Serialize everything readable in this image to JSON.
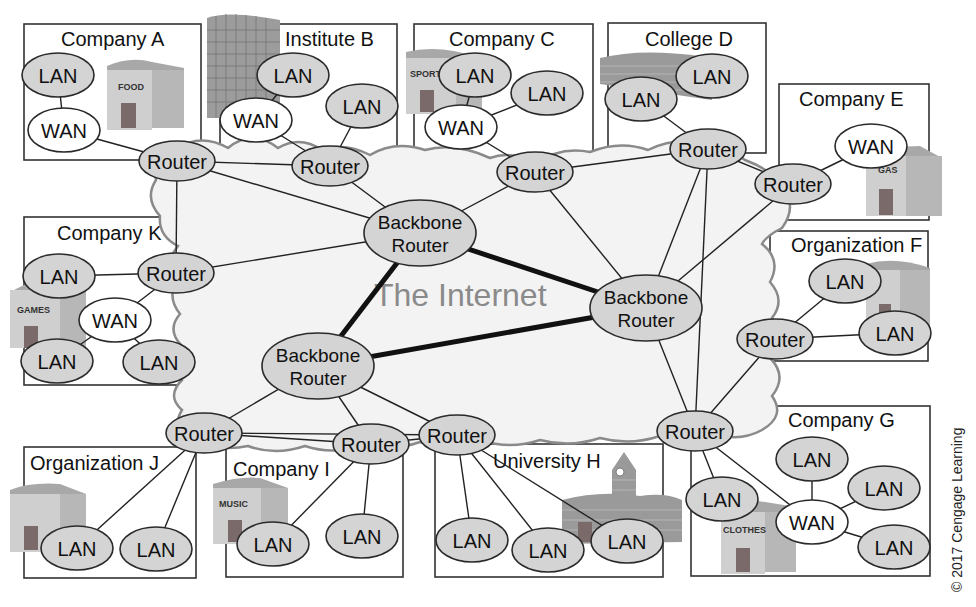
{
  "diagram": {
    "center_label": "The Internet",
    "copyright": "© 2017 Cengage Learning",
    "colors": {
      "node_fill": "#d4d4d4",
      "wan_fill": "#ffffff",
      "cloud_fill": "#f3f3f3",
      "cloud_stroke": "#8a8a8a",
      "internet_label": "#8a8a8a"
    },
    "organizations": [
      {
        "id": "A",
        "name": "Company A",
        "building_sign": "FOOD"
      },
      {
        "id": "B",
        "name": "Institute B",
        "building_sign": ""
      },
      {
        "id": "C",
        "name": "Company C",
        "building_sign": "SPORTS"
      },
      {
        "id": "D",
        "name": "College D",
        "building_sign": ""
      },
      {
        "id": "E",
        "name": "Company E",
        "building_sign": "GAS"
      },
      {
        "id": "F",
        "name": "Organization F",
        "building_sign": ""
      },
      {
        "id": "G",
        "name": "Company G",
        "building_sign": "CLOTHES"
      },
      {
        "id": "H",
        "name": "University H",
        "building_sign": ""
      },
      {
        "id": "I",
        "name": "Company I",
        "building_sign": "MUSIC"
      },
      {
        "id": "J",
        "name": "Organization J",
        "building_sign": ""
      },
      {
        "id": "K",
        "name": "Company K",
        "building_sign": "GAMES"
      }
    ],
    "node_labels": {
      "lan": "LAN",
      "wan": "WAN",
      "router": "Router",
      "backbone_line1": "Backbone",
      "backbone_line2": "Router"
    },
    "nodes": [
      {
        "id": "bb1",
        "type": "backbone",
        "x": 420,
        "y": 233
      },
      {
        "id": "bb2",
        "type": "backbone",
        "x": 646,
        "y": 308
      },
      {
        "id": "bb3",
        "type": "backbone",
        "x": 318,
        "y": 366
      },
      {
        "id": "rA",
        "type": "router",
        "x": 177,
        "y": 161,
        "org": "A"
      },
      {
        "id": "rB",
        "type": "router",
        "x": 330,
        "y": 166,
        "org": "B"
      },
      {
        "id": "rC",
        "type": "router",
        "x": 535,
        "y": 172,
        "org": "C"
      },
      {
        "id": "rD",
        "type": "router",
        "x": 708,
        "y": 149,
        "org": "D"
      },
      {
        "id": "rE",
        "type": "router",
        "x": 793,
        "y": 184,
        "org": "E"
      },
      {
        "id": "rF",
        "type": "router",
        "x": 775,
        "y": 339,
        "org": "F"
      },
      {
        "id": "rG",
        "type": "router",
        "x": 695,
        "y": 431,
        "org": "G"
      },
      {
        "id": "rH",
        "type": "router",
        "x": 457,
        "y": 435,
        "org": "H"
      },
      {
        "id": "rI",
        "type": "router",
        "x": 371,
        "y": 444,
        "org": "I"
      },
      {
        "id": "rJ",
        "type": "router",
        "x": 204,
        "y": 433,
        "org": "J"
      },
      {
        "id": "rK",
        "type": "router",
        "x": 176,
        "y": 273,
        "org": "K"
      },
      {
        "id": "lA1",
        "type": "lan",
        "x": 58,
        "y": 75
      },
      {
        "id": "wA",
        "type": "wan",
        "x": 64,
        "y": 130
      },
      {
        "id": "lB1",
        "type": "lan",
        "x": 293,
        "y": 75
      },
      {
        "id": "wB",
        "type": "wan",
        "x": 256,
        "y": 120
      },
      {
        "id": "lB2",
        "type": "lan",
        "x": 362,
        "y": 106
      },
      {
        "id": "lC1",
        "type": "lan",
        "x": 475,
        "y": 75
      },
      {
        "id": "wC",
        "type": "wan",
        "x": 461,
        "y": 127
      },
      {
        "id": "lC2",
        "type": "lan",
        "x": 547,
        "y": 93
      },
      {
        "id": "lD1",
        "type": "lan",
        "x": 641,
        "y": 99
      },
      {
        "id": "lD2",
        "type": "lan",
        "x": 712,
        "y": 76
      },
      {
        "id": "wE",
        "type": "wan",
        "x": 871,
        "y": 146
      },
      {
        "id": "lF1",
        "type": "lan",
        "x": 845,
        "y": 281
      },
      {
        "id": "lF2",
        "type": "lan",
        "x": 895,
        "y": 333
      },
      {
        "id": "lG1",
        "type": "lan",
        "x": 722,
        "y": 499
      },
      {
        "id": "wG",
        "type": "wan",
        "x": 812,
        "y": 522
      },
      {
        "id": "lG2",
        "type": "lan",
        "x": 812,
        "y": 459
      },
      {
        "id": "lG3",
        "type": "lan",
        "x": 884,
        "y": 488
      },
      {
        "id": "lG4",
        "type": "lan",
        "x": 894,
        "y": 547
      },
      {
        "id": "lH1",
        "type": "lan",
        "x": 472,
        "y": 540
      },
      {
        "id": "lH2",
        "type": "lan",
        "x": 548,
        "y": 550
      },
      {
        "id": "lH3",
        "type": "lan",
        "x": 627,
        "y": 541
      },
      {
        "id": "lI1",
        "type": "lan",
        "x": 273,
        "y": 544
      },
      {
        "id": "lI2",
        "type": "lan",
        "x": 362,
        "y": 536
      },
      {
        "id": "lJ1",
        "type": "lan",
        "x": 77,
        "y": 548
      },
      {
        "id": "lJ2",
        "type": "lan",
        "x": 156,
        "y": 549
      },
      {
        "id": "lK1",
        "type": "lan",
        "x": 59,
        "y": 276
      },
      {
        "id": "wK",
        "type": "wan",
        "x": 115,
        "y": 320
      },
      {
        "id": "lK2",
        "type": "lan",
        "x": 57,
        "y": 361
      },
      {
        "id": "lK3",
        "type": "lan",
        "x": 159,
        "y": 362
      }
    ],
    "edges": [
      {
        "from": "bb1",
        "to": "bb2",
        "kind": "backbone"
      },
      {
        "from": "bb1",
        "to": "bb3",
        "kind": "backbone"
      },
      {
        "from": "bb3",
        "to": "bb2",
        "kind": "backbone"
      },
      {
        "from": "rA",
        "to": "bb1"
      },
      {
        "from": "rA",
        "to": "rB"
      },
      {
        "from": "rA",
        "to": "rK"
      },
      {
        "from": "rB",
        "to": "bb1"
      },
      {
        "from": "rC",
        "to": "bb1"
      },
      {
        "from": "rC",
        "to": "bb2"
      },
      {
        "from": "rC",
        "to": "rD"
      },
      {
        "from": "rD",
        "to": "bb2"
      },
      {
        "from": "rD",
        "to": "rG"
      },
      {
        "from": "rD",
        "to": "rE"
      },
      {
        "from": "rE",
        "to": "bb2"
      },
      {
        "from": "rK",
        "to": "bb1"
      },
      {
        "from": "rF",
        "to": "rG"
      },
      {
        "from": "rG",
        "to": "bb2"
      },
      {
        "from": "bb3",
        "to": "rJ"
      },
      {
        "from": "bb3",
        "to": "rI"
      },
      {
        "from": "bb3",
        "to": "rH"
      },
      {
        "from": "rJ",
        "to": "rI"
      },
      {
        "from": "rJ",
        "to": "rH"
      },
      {
        "from": "rI",
        "to": "rH"
      },
      {
        "from": "lA1",
        "to": "wA"
      },
      {
        "from": "wA",
        "to": "rA"
      },
      {
        "from": "lB1",
        "to": "wB"
      },
      {
        "from": "wB",
        "to": "rB"
      },
      {
        "from": "lB2",
        "to": "rB"
      },
      {
        "from": "lC1",
        "to": "wC"
      },
      {
        "from": "lC2",
        "to": "wC"
      },
      {
        "from": "wC",
        "to": "rC"
      },
      {
        "from": "lD1",
        "to": "rD"
      },
      {
        "from": "wE",
        "to": "rE"
      },
      {
        "from": "lF1",
        "to": "rF"
      },
      {
        "from": "lF2",
        "to": "rF"
      },
      {
        "from": "lG1",
        "to": "rG"
      },
      {
        "from": "wG",
        "to": "rG"
      },
      {
        "from": "lG2",
        "to": "wG"
      },
      {
        "from": "lG3",
        "to": "wG"
      },
      {
        "from": "lG4",
        "to": "wG"
      },
      {
        "from": "lH1",
        "to": "rH"
      },
      {
        "from": "lH2",
        "to": "rH"
      },
      {
        "from": "lH3",
        "to": "rH"
      },
      {
        "from": "lI1",
        "to": "rI"
      },
      {
        "from": "lI2",
        "to": "rI"
      },
      {
        "from": "lJ1",
        "to": "rJ"
      },
      {
        "from": "lJ2",
        "to": "rJ"
      },
      {
        "from": "lK1",
        "to": "rK"
      },
      {
        "from": "wK",
        "to": "rK"
      },
      {
        "from": "lK2",
        "to": "wK"
      },
      {
        "from": "lK3",
        "to": "wK"
      }
    ]
  }
}
